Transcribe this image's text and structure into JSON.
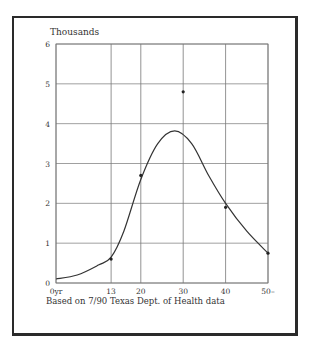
{
  "chart_data": {
    "type": "line",
    "title": "",
    "ylabel": "Thousands",
    "xlabel": "",
    "ylim": [
      0,
      6
    ],
    "xlim": [
      0,
      50
    ],
    "grid": true,
    "y_ticks": [
      "0",
      "1",
      "2",
      "3",
      "4",
      "5",
      "6"
    ],
    "x_ticks": [
      {
        "value": 0,
        "label": "0yr"
      },
      {
        "value": 13,
        "label": "13"
      },
      {
        "value": 20,
        "label": "20"
      },
      {
        "value": 30,
        "label": "30"
      },
      {
        "value": 40,
        "label": "40"
      },
      {
        "value": 50,
        "label": "50–"
      }
    ],
    "series": [
      {
        "name": "smoothed curve",
        "x": [
          0,
          5,
          10,
          13,
          16,
          20,
          24,
          28,
          32,
          36,
          40,
          45,
          50
        ],
        "values": [
          0.1,
          0.2,
          0.45,
          0.65,
          1.3,
          2.6,
          3.5,
          3.82,
          3.5,
          2.7,
          2.0,
          1.3,
          0.75
        ]
      },
      {
        "name": "data points",
        "x": [
          13,
          20,
          30,
          40,
          50
        ],
        "values": [
          0.6,
          2.7,
          4.8,
          1.9,
          0.75
        ]
      }
    ],
    "footnote": "Based on 7/90 Texas Dept. of Health data"
  },
  "labels": {
    "y_unit": "Thousands",
    "footnote": "Based on 7/90 Texas Dept. of Health data"
  }
}
